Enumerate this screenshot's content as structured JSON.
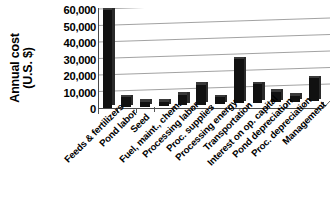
{
  "chart_data": {
    "type": "bar",
    "title": "",
    "subtitle": "",
    "xlabel": "",
    "ylabel": "Annual cost (U.S. $)",
    "ylabel_lines": [
      "Annual cost",
      "(U.S. $)"
    ],
    "ylim": [
      0,
      60000
    ],
    "ytick_values": [
      0,
      10000,
      20000,
      30000,
      40000,
      50000,
      60000
    ],
    "ytick_labels": [
      "0",
      "10,000",
      "20,000",
      "30,000",
      "40,000",
      "50,000",
      "60,000"
    ],
    "grid": true,
    "grid_axis": "y",
    "legend": "none",
    "bar_color": "#000000",
    "background_color": "#ffffff",
    "style_note": "3d-perspective",
    "categories": [
      "Feeds & fertilizers",
      "Pond labor",
      "Seed",
      "Fuel, maint., chem.",
      "Processing labor",
      "Proc. supplies",
      "Processing energy",
      "Transportation",
      "Interest on op. capital",
      "Pond depreciation",
      "Proc. depreciation",
      "Management"
    ],
    "values": [
      59000,
      6000,
      3000,
      2500,
      6500,
      12000,
      4000,
      27000,
      11500,
      6500,
      3500,
      14000
    ],
    "units": "U.S. $ per year"
  }
}
